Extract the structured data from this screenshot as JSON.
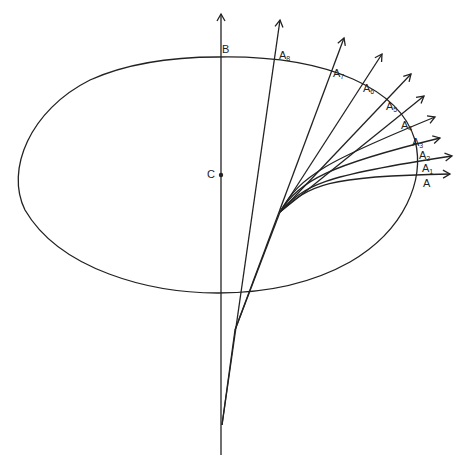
{
  "diagram": {
    "colors": {
      "stroke": "#222222",
      "background": "#ffffff"
    },
    "ellipse": {
      "cx": 218,
      "cy": 175,
      "rx": 203,
      "ry": 118
    },
    "points": {
      "B": {
        "label": "B",
        "x": 221,
        "y": 57
      },
      "C": {
        "label": "C",
        "x": 221,
        "y": 175
      },
      "A": {
        "label": "A",
        "x": 421,
        "y": 175
      }
    },
    "labels": [
      {
        "id": "B",
        "text": "B",
        "sub": "",
        "x": 222,
        "y": 44
      },
      {
        "id": "C",
        "text": "C",
        "sub": "",
        "x": 207,
        "y": 169
      },
      {
        "id": "A8",
        "text": "A",
        "sub": "8",
        "x": 279,
        "y": 50
      },
      {
        "id": "A7",
        "text": "A",
        "sub": "7",
        "x": 333,
        "y": 68
      },
      {
        "id": "A6",
        "text": "A",
        "sub": "6",
        "x": 363,
        "y": 83
      },
      {
        "id": "A5",
        "text": "A",
        "sub": "5",
        "x": 386,
        "y": 101
      },
      {
        "id": "A4",
        "text": "A",
        "sub": "4",
        "x": 401,
        "y": 120
      },
      {
        "id": "A3",
        "text": "A",
        "sub": "3",
        "x": 412,
        "y": 137
      },
      {
        "id": "A2",
        "text": "A",
        "sub": "2",
        "x": 419,
        "y": 150
      },
      {
        "id": "A1",
        "text": "A",
        "sub": "1",
        "x": 422,
        "y": 163
      },
      {
        "id": "A",
        "text": "A",
        "sub": "",
        "x": 423,
        "y": 178
      }
    ]
  }
}
